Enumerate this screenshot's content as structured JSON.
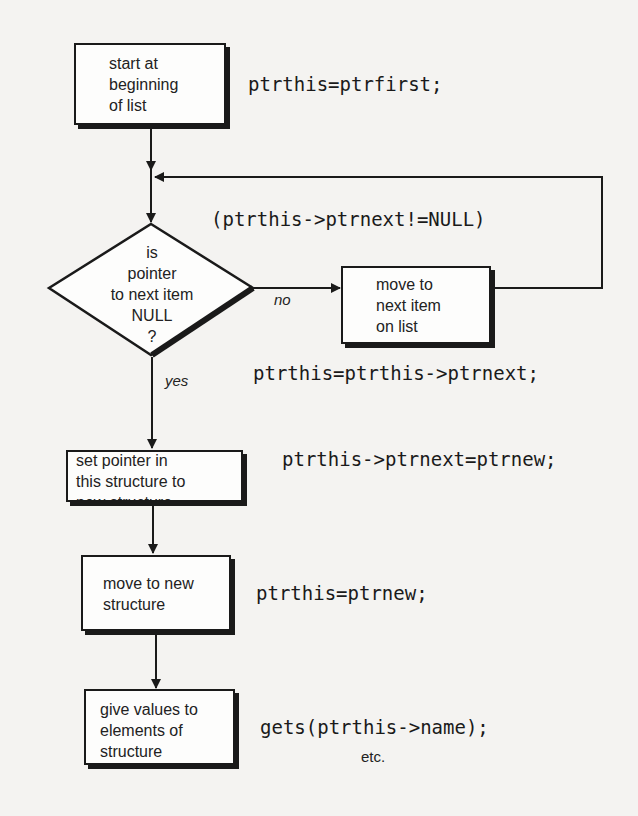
{
  "flowchart": {
    "nodes": [
      {
        "id": "start",
        "type": "process",
        "lines": [
          "start at",
          "beginning",
          "of list"
        ],
        "code": "ptrthis=ptrfirst;"
      },
      {
        "id": "decision",
        "type": "decision",
        "lines": [
          "is",
          "pointer",
          "to next item",
          "NULL",
          "?"
        ],
        "code": "(ptrthis->ptrnext!=NULL)"
      },
      {
        "id": "move-next",
        "type": "process",
        "lines": [
          "move to",
          "next item",
          "on list"
        ],
        "code": "ptrthis=ptrthis->ptrnext;"
      },
      {
        "id": "set-pointer",
        "type": "process",
        "lines": [
          "set pointer in",
          "this structure to",
          "new structure"
        ],
        "code": "ptrthis->ptrnext=ptrnew;"
      },
      {
        "id": "move-new",
        "type": "process",
        "lines": [
          "move to new",
          "structure"
        ],
        "code": "ptrthis=ptrnew;"
      },
      {
        "id": "give-values",
        "type": "process",
        "lines": [
          "give values to",
          "elements of",
          "structure"
        ],
        "code": "gets(ptrthis->name);",
        "note": "etc."
      }
    ],
    "edges": [
      {
        "from": "start",
        "to": "decision",
        "label": ""
      },
      {
        "from": "decision",
        "to": "move-next",
        "label": "no"
      },
      {
        "from": "move-next",
        "to": "decision",
        "label": ""
      },
      {
        "from": "decision",
        "to": "set-pointer",
        "label": "yes"
      },
      {
        "from": "set-pointer",
        "to": "move-new",
        "label": ""
      },
      {
        "from": "move-new",
        "to": "give-values",
        "label": ""
      }
    ]
  }
}
